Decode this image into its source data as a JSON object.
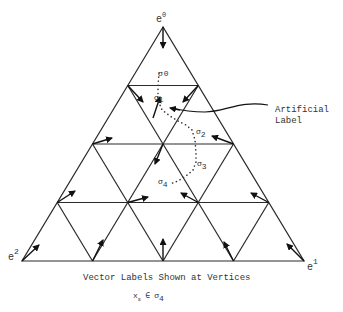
{
  "diagram": {
    "vertex_labels": {
      "top": {
        "base": "e",
        "sup": "0"
      },
      "bottom_right": {
        "base": "e",
        "sup": "1"
      },
      "bottom_left": {
        "base": "e",
        "sup": "2"
      }
    },
    "path_labels": [
      {
        "id": "sigma0",
        "base": "σ",
        "sub": "0"
      },
      {
        "id": "sigma1",
        "base": "σ",
        "sub": "1"
      },
      {
        "id": "sigma2",
        "base": "σ",
        "sub": "2"
      },
      {
        "id": "sigma3",
        "base": "σ",
        "sub": "3"
      },
      {
        "id": "sigma4",
        "base": "σ",
        "sub": "4"
      }
    ],
    "annotation": {
      "line1": "Artificial",
      "line2": "Label"
    },
    "caption": {
      "line1": "Vector Labels Shown at Vertices",
      "formula_x": "x",
      "formula_x_sub": "ε",
      "formula_in": "∈",
      "formula_sigma": "σ",
      "formula_sigma_sub": "4"
    },
    "grid": {
      "subdivisions": 4,
      "line_color": "#2a2a2a"
    }
  }
}
